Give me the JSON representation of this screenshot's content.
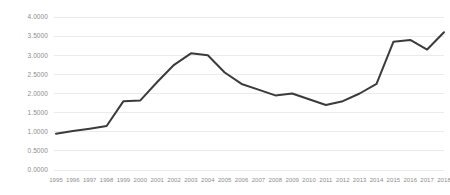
{
  "chart_data": {
    "type": "line",
    "title": "",
    "subtitle": "",
    "xlabel": "",
    "ylabel": "",
    "grid": true,
    "legend": false,
    "legend_position": "none",
    "line_color": "#3b3b3b",
    "grid_color": "#e6e6e6",
    "label_color": "#8c8c8c",
    "background_color": "#ffffff",
    "xlim": [
      1995,
      2018
    ],
    "ylim": [
      0.0,
      4.0
    ],
    "ytick_step": 0.5,
    "ytick_labels": [
      "0.0000",
      "0.5000",
      "1.0000",
      "1.5000",
      "2.0000",
      "2.5000",
      "3.0000",
      "3.5000",
      "4.0000"
    ],
    "ytick_values": [
      0.0,
      0.5,
      1.0,
      1.5,
      2.0,
      2.5,
      3.0,
      3.5,
      4.0
    ],
    "categories": [
      "1995",
      "1996",
      "1997",
      "1998",
      "1999",
      "2000",
      "2001",
      "2002",
      "2003",
      "2004",
      "2005",
      "2006",
      "2007",
      "2008",
      "2009",
      "2010",
      "2011",
      "2012",
      "2013",
      "2014",
      "2015",
      "2016",
      "2017",
      "2018"
    ],
    "x": [
      1995,
      1996,
      1997,
      1998,
      1999,
      2000,
      2001,
      2002,
      2003,
      2004,
      2005,
      2006,
      2007,
      2008,
      2009,
      2010,
      2011,
      2012,
      2013,
      2014,
      2015,
      2016,
      2017,
      2018
    ],
    "series": [
      {
        "name": "value",
        "values": [
          0.95,
          1.02,
          1.08,
          1.15,
          1.8,
          1.82,
          2.3,
          2.75,
          3.05,
          3.0,
          2.55,
          2.25,
          2.1,
          1.95,
          2.0,
          1.85,
          1.7,
          1.8,
          2.0,
          2.25,
          3.35,
          3.4,
          3.15,
          3.6
        ]
      }
    ]
  }
}
